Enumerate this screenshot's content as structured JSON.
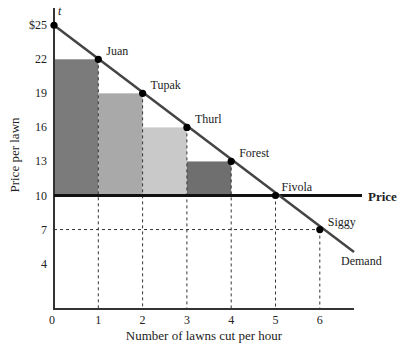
{
  "chart_data": {
    "type": "bar",
    "title": "",
    "xlabel": "Number of lawns cut per hour",
    "ylabel": "Price per lawn",
    "x_ticks": [
      "0",
      "1",
      "2",
      "3",
      "4",
      "5",
      "6"
    ],
    "y_ticks": [
      {
        "value": 25,
        "label": "$25"
      },
      {
        "value": 22,
        "label": "22"
      },
      {
        "value": 19,
        "label": "19"
      },
      {
        "value": 16,
        "label": "16"
      },
      {
        "value": 13,
        "label": "13"
      },
      {
        "value": 10,
        "label": "10"
      },
      {
        "value": 7,
        "label": "7"
      },
      {
        "value": 4,
        "label": "4"
      }
    ],
    "xlim": [
      0,
      6.7
    ],
    "ylim": [
      0,
      27
    ],
    "grid": false,
    "demand": {
      "name": "Demand",
      "points": [
        {
          "x": 0,
          "y": 25,
          "label": "t"
        },
        {
          "x": 1,
          "y": 22,
          "label": "Juan"
        },
        {
          "x": 2,
          "y": 19,
          "label": "Tupak"
        },
        {
          "x": 3,
          "y": 16,
          "label": "Thurl"
        },
        {
          "x": 4,
          "y": 13,
          "label": "Forest"
        },
        {
          "x": 5,
          "y": 10,
          "label": "Fivola"
        },
        {
          "x": 6,
          "y": 7,
          "label": "Siggy"
        }
      ]
    },
    "price_line": {
      "name": "Price",
      "value": 10
    },
    "surplus_bars": [
      {
        "x0": 0,
        "x1": 1,
        "bottom": 10,
        "top": 22,
        "color": "#7b7b7b"
      },
      {
        "x0": 1,
        "x1": 2,
        "bottom": 10,
        "top": 19,
        "color": "#a9a9a9"
      },
      {
        "x0": 2,
        "x1": 3,
        "bottom": 10,
        "top": 16,
        "color": "#c9c9c9"
      },
      {
        "x0": 3,
        "x1": 4,
        "bottom": 10,
        "top": 13,
        "color": "#6f6f6f"
      }
    ]
  }
}
